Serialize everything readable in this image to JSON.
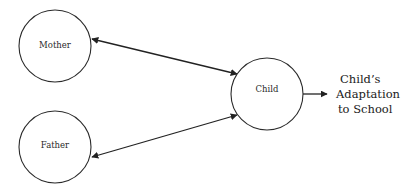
{
  "diagram": {
    "type": "relationship-diagram",
    "nodes": [
      {
        "id": "mother",
        "label": "Mother",
        "cx": 55,
        "cy": 46,
        "r": 36
      },
      {
        "id": "father",
        "label": "Father",
        "cx": 55,
        "cy": 147,
        "r": 36
      },
      {
        "id": "child",
        "label": "Child",
        "cx": 267,
        "cy": 94,
        "r": 36
      }
    ],
    "edges": [
      {
        "from": "mother",
        "to": "child",
        "direction": "bidirectional"
      },
      {
        "from": "father",
        "to": "child",
        "direction": "bidirectional"
      },
      {
        "from": "child",
        "to": "outcome",
        "direction": "forward"
      }
    ],
    "outcome": {
      "lines": [
        "Child’s",
        "Adaptation",
        "to School"
      ]
    },
    "colors": {
      "stroke": "#2b2b2b",
      "arrow": "#222222",
      "background": "#ffffff"
    }
  }
}
